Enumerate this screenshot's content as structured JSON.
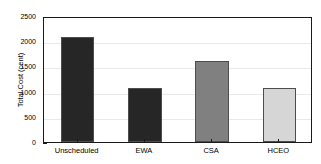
{
  "chart_data": {
    "type": "bar",
    "title": "",
    "xlabel": "",
    "ylabel": "Total Cost (cent)",
    "categories": [
      "Unscheduled",
      "EWA",
      "CSA",
      "HCEO"
    ],
    "values": [
      2090,
      1070,
      1600,
      1080
    ],
    "bar_colors": [
      "#262626",
      "#262626",
      "#808080",
      "#d6d6d6"
    ],
    "bar_edge_color": "#4d4d4d",
    "ylim": [
      0,
      2500
    ],
    "yticks": [
      0,
      500,
      1000,
      1500,
      2000,
      2500
    ],
    "ytick_labels": [
      "0",
      "500",
      "1000",
      "1500",
      "2000",
      "2500"
    ],
    "grid": true,
    "grid_color": "#e9e9e9",
    "legend": null,
    "axis_color": "#1a1a1a",
    "background_color": "#ffffff"
  }
}
